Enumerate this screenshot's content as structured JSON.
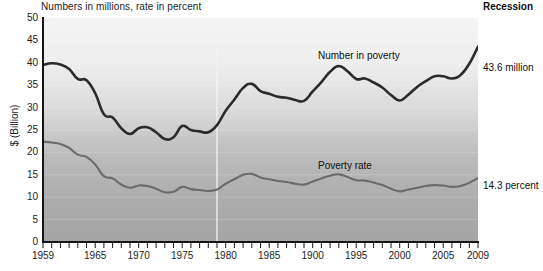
{
  "figure": {
    "subtitle": "Numbers in millions, rate in percent",
    "recession_label": "Recession",
    "y_axis_title": "$ (Billion)",
    "end_labels": {
      "number": "43.6 million",
      "rate": "14.3 percent"
    },
    "series_labels": {
      "number": "Number in poverty",
      "rate": "Poverty rate"
    },
    "colors": {
      "number_line": "#2b2b2b",
      "rate_line": "#6b6b6b",
      "axis": "#1a1a1a",
      "plot_bg_top": "#f2f2f2",
      "plot_bg_bottom": "#a8a8a8",
      "recession_marker": "#f4f4f4"
    }
  },
  "chart_data": {
    "type": "line",
    "title": "",
    "subtitle": "Numbers in millions, rate in percent",
    "xlabel": "",
    "ylabel": "$ (Billion)",
    "xlim": [
      1959,
      2009
    ],
    "ylim": [
      0,
      50
    ],
    "yticks": [
      0,
      5,
      10,
      15,
      20,
      25,
      30,
      35,
      40,
      45,
      50
    ],
    "xticks_labeled": [
      "1959",
      "1965",
      "1970",
      "1975",
      "1980",
      "1985",
      "1900",
      "1995",
      "2000",
      "2005",
      "2009"
    ],
    "xticks_labeled_values": [
      1959,
      1965,
      1970,
      1975,
      1980,
      1985,
      1990,
      1995,
      2000,
      2005,
      2009
    ],
    "xtick_interval_years": 1,
    "grid": true,
    "legend": "inline-annotations",
    "annotations": [
      {
        "text": "Recession",
        "position": "top-right"
      },
      {
        "text": "Number in poverty",
        "position": "above-upper-line"
      },
      {
        "text": "Poverty rate",
        "position": "above-lower-line"
      },
      {
        "text": "43.6 million",
        "position": "right-end-upper"
      },
      {
        "text": "14.3 percent",
        "position": "right-end-lower"
      }
    ],
    "recession_marker_year": 1979,
    "x": [
      1959,
      1960,
      1961,
      1962,
      1963,
      1964,
      1965,
      1966,
      1967,
      1968,
      1969,
      1970,
      1971,
      1972,
      1973,
      1974,
      1975,
      1976,
      1977,
      1978,
      1979,
      1980,
      1981,
      1982,
      1983,
      1984,
      1985,
      1986,
      1987,
      1988,
      1989,
      1990,
      1991,
      1992,
      1993,
      1994,
      1995,
      1996,
      1997,
      1998,
      1999,
      2000,
      2001,
      2002,
      2003,
      2004,
      2005,
      2006,
      2007,
      2008,
      2009
    ],
    "series": [
      {
        "name": "Number in poverty",
        "unit": "millions",
        "color": "#2b2b2b",
        "values": [
          39.5,
          39.9,
          39.6,
          38.6,
          36.4,
          36.1,
          33.2,
          28.5,
          27.8,
          25.4,
          24.1,
          25.4,
          25.6,
          24.5,
          23.0,
          23.4,
          25.9,
          25.0,
          24.7,
          24.5,
          26.1,
          29.3,
          31.8,
          34.4,
          35.3,
          33.7,
          33.1,
          32.4,
          32.2,
          31.7,
          31.5,
          33.6,
          35.7,
          38.0,
          39.3,
          38.1,
          36.4,
          36.5,
          35.6,
          34.5,
          32.8,
          31.6,
          32.9,
          34.6,
          35.9,
          37.0,
          37.0,
          36.5,
          37.3,
          39.8,
          43.6
        ]
      },
      {
        "name": "Poverty rate",
        "unit": "percent",
        "color": "#6b6b6b",
        "values": [
          22.4,
          22.2,
          21.9,
          21.0,
          19.5,
          19.0,
          17.3,
          14.7,
          14.2,
          12.8,
          12.1,
          12.6,
          12.5,
          11.9,
          11.1,
          11.2,
          12.3,
          11.8,
          11.6,
          11.4,
          11.7,
          13.0,
          14.0,
          15.0,
          15.2,
          14.4,
          14.0,
          13.6,
          13.4,
          13.0,
          12.8,
          13.5,
          14.2,
          14.8,
          15.1,
          14.5,
          13.8,
          13.7,
          13.3,
          12.7,
          11.9,
          11.3,
          11.7,
          12.1,
          12.5,
          12.7,
          12.6,
          12.3,
          12.5,
          13.2,
          14.3
        ]
      }
    ]
  }
}
